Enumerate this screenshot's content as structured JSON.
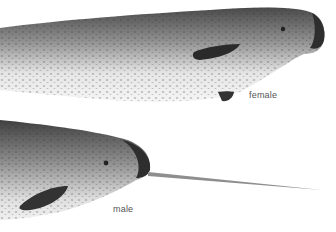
{
  "illustration": {
    "subject": "narwhal",
    "labels": {
      "female": "female",
      "male": "male"
    },
    "colors": {
      "background": "#ffffff",
      "body_dark": "#3a3a3a",
      "body_mid": "#8a8a8a",
      "belly": "#f2f2f2",
      "tusk": "#9a9a9a",
      "label_text": "#555555"
    }
  }
}
